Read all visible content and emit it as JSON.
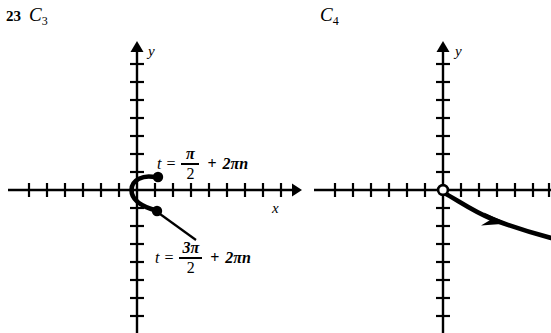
{
  "figure": {
    "background": "#ffffff",
    "ink": "#000000",
    "panels": [
      {
        "id": "panel-left",
        "problem_number": "23",
        "curve_label": "C",
        "curve_subscript": "3",
        "axes": {
          "x_axis_letter": "x",
          "y_axis_letter": "y",
          "origin": [
            137,
            190
          ],
          "x_range_px": [
            8,
            300
          ],
          "y_range_px": [
            42,
            333
          ],
          "tick_spacing_px": 18,
          "x_arrow": "right",
          "y_arrow": "up"
        },
        "endpoints": [
          {
            "type": "closed-dot",
            "at": [
              158,
              177
            ],
            "parameter": "t = pi/2 + 2*pi*n"
          },
          {
            "type": "closed-dot",
            "at": [
              157,
              211
            ],
            "parameter": "t = 3pi/2 + 2pi*n"
          }
        ],
        "annotations": [
          {
            "id": "eqn-top",
            "variable": "t",
            "equals": "=",
            "numerator": "π",
            "denominator": "2",
            "plus": "+",
            "term": "2πn",
            "leader_from": [
              158,
              177
            ]
          },
          {
            "id": "eqn-bottom",
            "variable": "t",
            "equals": "=",
            "numerator": "3π",
            "denominator": "2",
            "plus": "+",
            "term": "2πn",
            "leader_from": [
              157,
              211
            ]
          }
        ]
      },
      {
        "id": "panel-right",
        "problem_number": "",
        "curve_label": "C",
        "curve_subscript": "4",
        "axes": {
          "x_axis_letter": "",
          "y_axis_letter": "y",
          "origin": [
            443,
            190
          ],
          "x_range_px": [
            314,
            551
          ],
          "y_range_px": [
            42,
            333
          ],
          "tick_spacing_px": 18,
          "x_arrow": "none",
          "y_arrow": "up"
        },
        "endpoints": [
          {
            "type": "open-circle",
            "at": [
              443,
              190
            ],
            "parameter": ""
          }
        ],
        "annotations": [],
        "direction_arrow": {
          "at": [
            505,
            223
          ],
          "points": "right-down"
        }
      }
    ]
  }
}
